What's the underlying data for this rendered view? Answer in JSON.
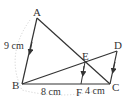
{
  "diagram": {
    "type": "geometry",
    "points": {
      "A": {
        "label": "A",
        "x": 37,
        "y": 18
      },
      "B": {
        "label": "B",
        "x": 22,
        "y": 84
      },
      "C": {
        "label": "C",
        "x": 110,
        "y": 84
      },
      "D": {
        "label": "D",
        "x": 117,
        "y": 51
      },
      "E": {
        "label": "E",
        "x": 85,
        "y": 62
      },
      "F": {
        "label": "F",
        "x": 81,
        "y": 84
      }
    },
    "segments": [
      "AB",
      "AC",
      "BD",
      "DC",
      "BC",
      "EF"
    ],
    "parallel": [
      "AB",
      "EF",
      "DC"
    ],
    "measurements": {
      "AB": "9 cm",
      "BF": "8 cm",
      "FC": "4 cm"
    },
    "colors": {
      "line": "#333333",
      "guide": "#cccccc"
    }
  }
}
